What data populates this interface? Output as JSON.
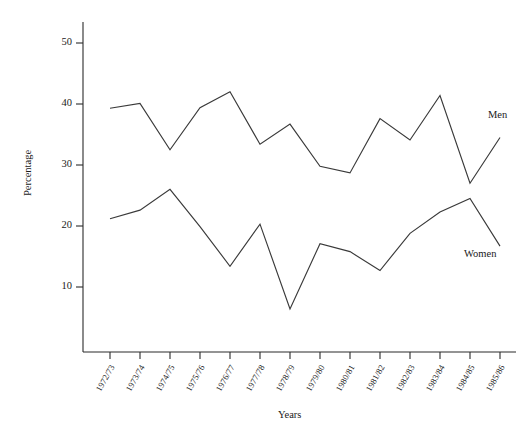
{
  "chart_data": {
    "type": "line",
    "title": "",
    "xlabel": "Years",
    "ylabel": "Percentage",
    "grid": false,
    "legend_position": "inline-right-end-of-line",
    "ylim": [
      0,
      55
    ],
    "yticks": [
      10,
      20,
      30,
      40,
      50
    ],
    "ytick_labels": [
      "10",
      "20",
      "30",
      "40",
      "50"
    ],
    "categories": [
      "1972/73",
      "1973/74",
      "1974/75",
      "1975/76",
      "1976/77",
      "1977/78",
      "1978/79",
      "1979/80",
      "1980/81",
      "1981/82",
      "1982/83",
      "1983/84",
      "1984/85",
      "1985/86"
    ],
    "series": [
      {
        "name": "Men",
        "values": [
          39.3,
          40.1,
          32.5,
          39.4,
          42.0,
          33.4,
          36.7,
          29.8,
          28.7,
          37.6,
          34.1,
          41.4,
          27.0,
          34.5
        ]
      },
      {
        "name": "Women",
        "values": [
          21.2,
          22.6,
          26.0,
          19.9,
          13.4,
          20.3,
          6.4,
          17.1,
          15.8,
          12.7,
          18.8,
          22.3,
          24.5,
          16.7
        ]
      }
    ],
    "annotations": [
      {
        "text": "Men",
        "series": "Men"
      },
      {
        "text": "Women",
        "series": "Women"
      }
    ]
  },
  "axes": {
    "y_title": "Percentage",
    "x_title": "Years"
  }
}
